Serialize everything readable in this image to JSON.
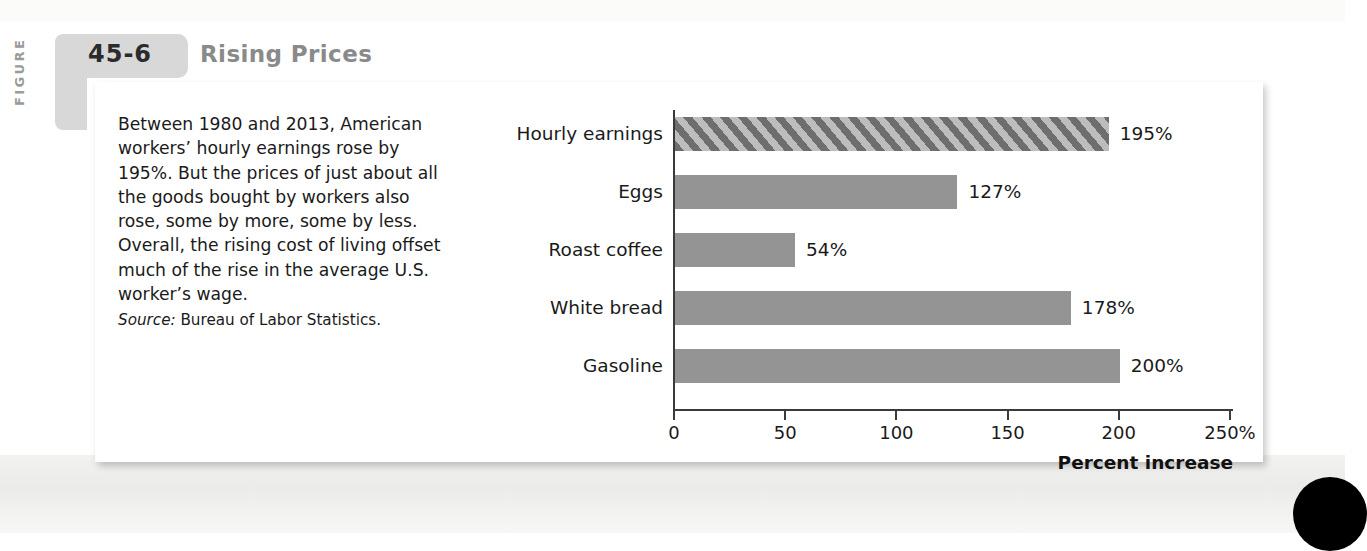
{
  "figure": {
    "tab_label": "FIGURE",
    "number": "45-6",
    "title": "Rising Prices"
  },
  "caption": {
    "body": "Between 1980 and 2013, American workers’ hourly earnings rose by 195%. But the prices of just about all the goods bought by workers also rose, some by more, some by less. Overall, the rising cost of living offset much of the rise in the average U.S. worker’s wage.",
    "source_word": "Source:",
    "source_text": " Bureau of Labor Statistics."
  },
  "colors": {
    "bar_fill": "#949494",
    "hatch_dark": "#6e6e6e",
    "hatch_light": "#bdbdbd",
    "tab_gray": "#d8d8d8",
    "title_gray": "#8a8a8a",
    "axis": "#3a3a3a"
  },
  "chart_data": {
    "type": "bar",
    "orientation": "horizontal",
    "title": "Rising Prices",
    "categories": [
      "Hourly earnings",
      "Eggs",
      "Roast coffee",
      "White bread",
      "Gasoline"
    ],
    "values": [
      195,
      127,
      54,
      178,
      200
    ],
    "data_labels": [
      "195%",
      "127%",
      "54%",
      "178%",
      "200%"
    ],
    "highlight_index": 0,
    "highlight_style": "hatched",
    "xlabel": "Percent increase",
    "ylabel": "",
    "xlim": [
      0,
      250
    ],
    "xticks": [
      0,
      50,
      100,
      150,
      200,
      250
    ],
    "xtick_labels": [
      "0",
      "50",
      "100",
      "150",
      "200",
      "250%"
    ],
    "grid": false,
    "legend": "none",
    "source": "Bureau of Labor Statistics."
  }
}
